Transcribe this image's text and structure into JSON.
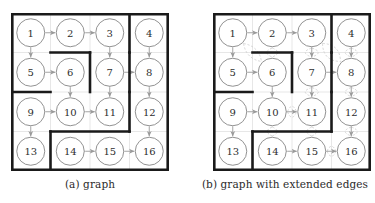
{
  "page": {
    "background": "#ffffff",
    "figure_count": 2
  },
  "style": {
    "wall_color": "#1a1a1a",
    "grid_color": "#dcdcdc",
    "node_stroke": "#8c8c8c",
    "node_fill": "#ffffff",
    "edge_color": "#9a9a9a",
    "extended_edge_color": "#cfcfcf",
    "label_color": "#2e2e2e",
    "caption_color": "#2b2b2b",
    "wall_thickness": 2.6,
    "grid_thickness": 0.7,
    "node_radius": 14,
    "cell_size": 39.5
  },
  "figures": [
    {
      "id": "figure-a",
      "caption": "(a) graph",
      "has_extended_edges": false,
      "grid": {
        "rows": 4,
        "cols": 4
      },
      "nodes": [
        {
          "id": 1,
          "label": "1",
          "row": 0,
          "col": 0
        },
        {
          "id": 2,
          "label": "2",
          "row": 0,
          "col": 1
        },
        {
          "id": 3,
          "label": "3",
          "row": 0,
          "col": 2
        },
        {
          "id": 4,
          "label": "4",
          "row": 0,
          "col": 3
        },
        {
          "id": 5,
          "label": "5",
          "row": 1,
          "col": 0
        },
        {
          "id": 6,
          "label": "6",
          "row": 1,
          "col": 1
        },
        {
          "id": 7,
          "label": "7",
          "row": 1,
          "col": 2
        },
        {
          "id": 8,
          "label": "8",
          "row": 1,
          "col": 3
        },
        {
          "id": 9,
          "label": "9",
          "row": 2,
          "col": 0
        },
        {
          "id": 10,
          "label": "10",
          "row": 2,
          "col": 1
        },
        {
          "id": 11,
          "label": "11",
          "row": 2,
          "col": 2
        },
        {
          "id": 12,
          "label": "12",
          "row": 2,
          "col": 3
        },
        {
          "id": 13,
          "label": "13",
          "row": 3,
          "col": 0
        },
        {
          "id": 14,
          "label": "14",
          "row": 3,
          "col": 1
        },
        {
          "id": 15,
          "label": "15",
          "row": 3,
          "col": 2
        },
        {
          "id": 16,
          "label": "16",
          "row": 3,
          "col": 3
        }
      ],
      "edges": [
        {
          "from": 1,
          "to": 2
        },
        {
          "from": 2,
          "to": 3
        },
        {
          "from": 1,
          "to": 5
        },
        {
          "from": 3,
          "to": 7
        },
        {
          "from": 4,
          "to": 8
        },
        {
          "from": 5,
          "to": 6
        },
        {
          "from": 7,
          "to": 8
        },
        {
          "from": 6,
          "to": 10
        },
        {
          "from": 7,
          "to": 11
        },
        {
          "from": 8,
          "to": 12
        },
        {
          "from": 9,
          "to": 10
        },
        {
          "from": 10,
          "to": 11
        },
        {
          "from": 9,
          "to": 13
        },
        {
          "from": 12,
          "to": 16
        },
        {
          "from": 14,
          "to": 15
        },
        {
          "from": 15,
          "to": 16
        }
      ],
      "extended_edges": [],
      "walls": [
        {
          "kind": "border"
        },
        {
          "kind": "v",
          "row": 0,
          "col": 3,
          "len": 1
        },
        {
          "kind": "v",
          "row": 1,
          "col": 3,
          "len": 1
        },
        {
          "kind": "h",
          "row": 1,
          "col": 1,
          "len": 1
        },
        {
          "kind": "v",
          "row": 1,
          "col": 2,
          "len": 1
        },
        {
          "kind": "h",
          "row": 2,
          "col": 0,
          "len": 1
        },
        {
          "kind": "v",
          "row": 2,
          "col": 3,
          "len": 1
        },
        {
          "kind": "h",
          "row": 3,
          "col": 1,
          "len": 2
        },
        {
          "kind": "v",
          "row": 3,
          "col": 1,
          "len": 1
        }
      ]
    },
    {
      "id": "figure-b",
      "caption": "(b) graph with extended edges",
      "has_extended_edges": true,
      "grid": {
        "rows": 4,
        "cols": 4
      },
      "nodes": [
        {
          "id": 1,
          "label": "1",
          "row": 0,
          "col": 0
        },
        {
          "id": 2,
          "label": "2",
          "row": 0,
          "col": 1
        },
        {
          "id": 3,
          "label": "3",
          "row": 0,
          "col": 2
        },
        {
          "id": 4,
          "label": "4",
          "row": 0,
          "col": 3
        },
        {
          "id": 5,
          "label": "5",
          "row": 1,
          "col": 0
        },
        {
          "id": 6,
          "label": "6",
          "row": 1,
          "col": 1
        },
        {
          "id": 7,
          "label": "7",
          "row": 1,
          "col": 2
        },
        {
          "id": 8,
          "label": "8",
          "row": 1,
          "col": 3
        },
        {
          "id": 9,
          "label": "9",
          "row": 2,
          "col": 0
        },
        {
          "id": 10,
          "label": "10",
          "row": 2,
          "col": 1
        },
        {
          "id": 11,
          "label": "11",
          "row": 2,
          "col": 2
        },
        {
          "id": 12,
          "label": "12",
          "row": 2,
          "col": 3
        },
        {
          "id": 13,
          "label": "13",
          "row": 3,
          "col": 0
        },
        {
          "id": 14,
          "label": "14",
          "row": 3,
          "col": 1
        },
        {
          "id": 15,
          "label": "15",
          "row": 3,
          "col": 2
        },
        {
          "id": 16,
          "label": "16",
          "row": 3,
          "col": 3
        }
      ],
      "edges": [
        {
          "from": 1,
          "to": 2
        },
        {
          "from": 2,
          "to": 3
        },
        {
          "from": 1,
          "to": 5
        },
        {
          "from": 3,
          "to": 7
        },
        {
          "from": 4,
          "to": 8
        },
        {
          "from": 5,
          "to": 6
        },
        {
          "from": 7,
          "to": 8
        },
        {
          "from": 6,
          "to": 10
        },
        {
          "from": 7,
          "to": 11
        },
        {
          "from": 8,
          "to": 12
        },
        {
          "from": 9,
          "to": 10
        },
        {
          "from": 10,
          "to": 11
        },
        {
          "from": 9,
          "to": 13
        },
        {
          "from": 12,
          "to": 16
        },
        {
          "from": 14,
          "to": 15
        },
        {
          "from": 15,
          "to": 16
        }
      ],
      "extended_edges": [
        {
          "from": 2,
          "to": 6,
          "bow": 11
        },
        {
          "from": 1,
          "to": 6,
          "bow": 9
        },
        {
          "from": 3,
          "to": 7,
          "bow": 13
        },
        {
          "from": 3,
          "to": 8,
          "bow": 12
        },
        {
          "from": 4,
          "to": 8,
          "bow": 12
        },
        {
          "from": 7,
          "to": 11,
          "bow": 13
        },
        {
          "from": 8,
          "to": 12,
          "bow": 12
        },
        {
          "from": 10,
          "to": 11,
          "bow": 11
        },
        {
          "from": 10,
          "to": 14,
          "bow": 10
        },
        {
          "from": 11,
          "to": 15,
          "bow": 10
        },
        {
          "from": 12,
          "to": 16,
          "bow": 12
        },
        {
          "from": 15,
          "to": 16,
          "bow": 10
        }
      ],
      "walls": [
        {
          "kind": "border"
        },
        {
          "kind": "v",
          "row": 0,
          "col": 3,
          "len": 1
        },
        {
          "kind": "v",
          "row": 1,
          "col": 3,
          "len": 1
        },
        {
          "kind": "h",
          "row": 1,
          "col": 1,
          "len": 1
        },
        {
          "kind": "v",
          "row": 1,
          "col": 2,
          "len": 1
        },
        {
          "kind": "h",
          "row": 2,
          "col": 0,
          "len": 1
        },
        {
          "kind": "v",
          "row": 2,
          "col": 3,
          "len": 1
        },
        {
          "kind": "h",
          "row": 3,
          "col": 1,
          "len": 2
        },
        {
          "kind": "v",
          "row": 3,
          "col": 1,
          "len": 1
        }
      ]
    }
  ]
}
